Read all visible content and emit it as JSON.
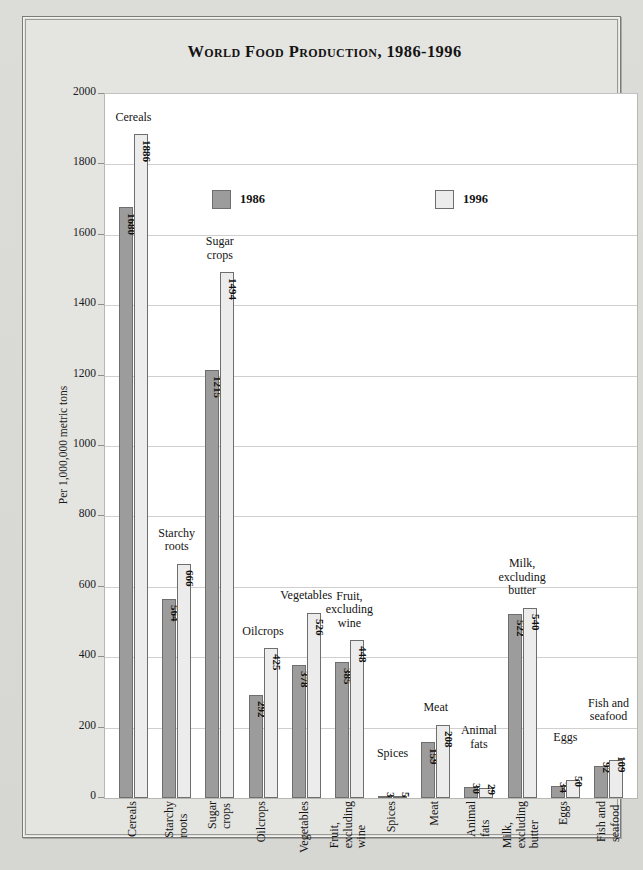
{
  "title": "World Food Production, 1986-1996",
  "legend": [
    {
      "label": "1986",
      "color": "#9c9c9c"
    },
    {
      "label": "1996",
      "color": "#ececec"
    }
  ],
  "axis": {
    "ylabel": "Per 1,000,000 metric tons",
    "yticks": [
      "0",
      "200",
      "400",
      "600",
      "800",
      "1000",
      "1200",
      "1400",
      "1600",
      "1800",
      "2000"
    ]
  },
  "chart_data": {
    "type": "bar",
    "title": "World Food Production, 1986-1996",
    "xlabel": "",
    "ylabel": "Per 1,000,000 metric tons",
    "ylim": [
      0,
      2000
    ],
    "ytick_step": 200,
    "grid": true,
    "legend_position": "top-right inside plot",
    "categories": [
      "Cereals",
      "Starchy roots",
      "Sugar crops",
      "Oilcrops",
      "Vegetables",
      "Fruit, excluding wine",
      "Spices",
      "Meat",
      "Animal fats",
      "Milk, excluding butter",
      "Eggs",
      "Fish and seafood"
    ],
    "category_label_lines": [
      [
        "Cereals"
      ],
      [
        "Starchy",
        "roots"
      ],
      [
        "Sugar",
        "crops"
      ],
      [
        "Oilcrops"
      ],
      [
        "Vegetables"
      ],
      [
        "Fruit,",
        "excluding",
        "wine"
      ],
      [
        "Spices"
      ],
      [
        "Meat"
      ],
      [
        "Animal",
        "fats"
      ],
      [
        "Milk,",
        "excluding",
        "butter"
      ],
      [
        "Eggs"
      ],
      [
        "Fish and",
        "seafood"
      ]
    ],
    "series": [
      {
        "name": "1986",
        "color": "#9c9c9c",
        "values": [
          1680,
          564,
          1215,
          292,
          378,
          385,
          3,
          159,
          30,
          522,
          34,
          92
        ]
      },
      {
        "name": "1996",
        "color": "#ececec",
        "values": [
          1886,
          666,
          1494,
          425,
          526,
          448,
          5,
          208,
          29,
          540,
          50,
          109
        ]
      }
    ]
  }
}
